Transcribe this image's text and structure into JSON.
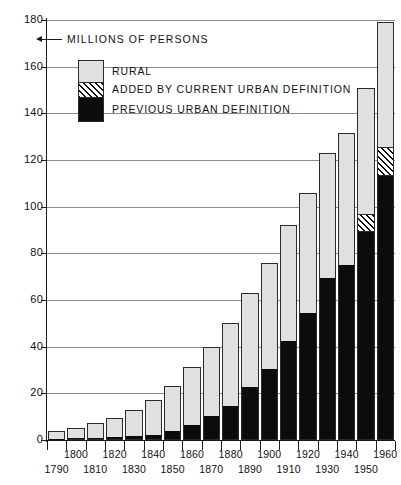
{
  "units_note": {
    "icon": "left-arrow-icon",
    "text": "MILLIONS OF PERSONS"
  },
  "legend": {
    "items": [
      {
        "key": "rural",
        "label": "RURAL",
        "swatch": "light-gray-fill"
      },
      {
        "key": "added",
        "label": "ADDED BY CURRENT URBAN DEFINITION",
        "swatch": "diagonal-hatch-fill"
      },
      {
        "key": "prev",
        "label": "PREVIOUS URBAN DEFINITION",
        "swatch": "black-fill"
      }
    ]
  },
  "colors": {
    "rural": "#e0e0e0",
    "added": "#ffffff",
    "previous_urban": "#0c0c0c",
    "axis": "#1a1a1a",
    "grid": "#8c8c8c"
  },
  "chart_data": {
    "type": "bar",
    "stacked": true,
    "title": "",
    "subtitle": "",
    "xlabel": "",
    "ylabel": "MILLIONS OF PERSONS",
    "ylim": [
      0,
      180
    ],
    "ytick_values": [
      0,
      20,
      40,
      60,
      80,
      100,
      120,
      140,
      160,
      180
    ],
    "ytick_labels": [
      "0",
      "20",
      "40",
      "60",
      "80",
      "100",
      "120",
      "140",
      "160",
      "180"
    ],
    "grid": "horizontal",
    "legend_position": "upper-left-inside",
    "categories": [
      "1790",
      "1800",
      "1810",
      "1820",
      "1830",
      "1840",
      "1850",
      "1860",
      "1870",
      "1880",
      "1890",
      "1900",
      "1910",
      "1920",
      "1930",
      "1940",
      "1950",
      "1960"
    ],
    "series": [
      {
        "name": "PREVIOUS URBAN DEFINITION",
        "values": [
          0.2,
          0.3,
          0.5,
          0.7,
          1.1,
          1.8,
          3.5,
          6.2,
          9.9,
          14.1,
          22.1,
          30.2,
          42.0,
          54.2,
          69.0,
          74.4,
          88.9,
          112.6
        ]
      },
      {
        "name": "ADDED BY CURRENT URBAN DEFINITION",
        "values": [
          0,
          0,
          0,
          0,
          0,
          0,
          0,
          0,
          0,
          0,
          0,
          0,
          0,
          0,
          0,
          0,
          7.5,
          12.7
        ]
      },
      {
        "name": "RURAL",
        "values": [
          3.7,
          5.0,
          6.7,
          8.9,
          11.8,
          15.3,
          19.7,
          25.2,
          29.9,
          36.1,
          40.8,
          45.8,
          50.0,
          51.5,
          53.8,
          57.3,
          54.3,
          54.0
        ]
      }
    ],
    "totals": [
      3.9,
      5.3,
      7.2,
      9.6,
      12.9,
      17.1,
      23.2,
      31.4,
      39.8,
      50.2,
      62.9,
      76.0,
      92.0,
      105.7,
      122.8,
      131.7,
      150.7,
      179.3
    ]
  }
}
